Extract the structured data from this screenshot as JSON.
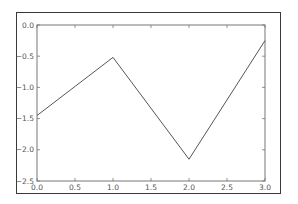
{
  "chart_data": {
    "type": "line",
    "title": "",
    "xlabel": "",
    "ylabel": "",
    "x": [
      0,
      1,
      2,
      3
    ],
    "series": [
      {
        "name": "line",
        "values": [
          -1.45,
          -0.52,
          -2.15,
          -0.25
        ],
        "color": "#555555"
      }
    ],
    "xlim": [
      0.0,
      3.0
    ],
    "ylim": [
      -2.5,
      0.0
    ],
    "xticks": [
      "0.0",
      "0.5",
      "1.0",
      "1.5",
      "2.0",
      "2.5",
      "3.0"
    ],
    "yticks": [
      "0.0",
      "-0.5",
      "-1.0",
      "-1.5",
      "-2.0",
      "-2.5"
    ],
    "grid": false,
    "legend": null
  },
  "colors": {
    "line": "#555555",
    "axes": "#666666",
    "frame": "#3a3a3a"
  }
}
